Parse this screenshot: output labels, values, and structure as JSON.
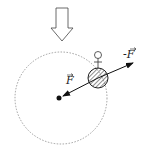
{
  "diagram": {
    "type": "physics-force-diagram",
    "labels": {
      "force": "F",
      "reaction_force": "-F"
    },
    "elements": [
      {
        "name": "gravity-direction-arrow",
        "shape": "hollow block arrow pointing down"
      },
      {
        "name": "orbit-circle",
        "shape": "dashed circle"
      },
      {
        "name": "center-point",
        "shape": "filled dot"
      },
      {
        "name": "ball",
        "shape": "hatched circle"
      },
      {
        "name": "person-figure",
        "shape": "small stick figure on top of ball"
      },
      {
        "name": "force-arrow",
        "shape": "double-headed arrow through ball toward center"
      }
    ],
    "colors": {
      "stroke": "#222222",
      "dashed": "#777777",
      "background": "#ffffff"
    }
  }
}
